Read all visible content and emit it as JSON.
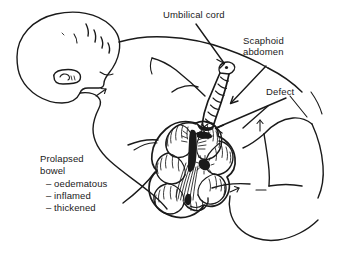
{
  "figure": {
    "background_color": "#ffffff",
    "ink_color": "#1a1a1a",
    "width": 341,
    "height": 260
  },
  "labels": {
    "umbilical_cord": "Umbilical cord",
    "scaphoid_abdomen_line1": "Scaphoid",
    "scaphoid_abdomen_line2": "abdomen",
    "defect": "Defect",
    "prolapsed_line1": "Prolapsed",
    "prolapsed_line2": "bowel",
    "prolapsed_item1": "– oedematous",
    "prolapsed_item2": "– inflamed",
    "prolapsed_item3": "– thickened"
  },
  "anatomy": {
    "head": "infant-head-profile",
    "ear": "ear",
    "hair": "hair-strokes",
    "neck": "neck",
    "torso": "torso",
    "arm": "arm",
    "legs": "legs",
    "umbilical_cord": "twisted-umbilical-cord",
    "cord_clamp": "cord-tip",
    "bowel_mass": "prolapsed-bowel-loops",
    "mesentery_shading": "dark-mesentery-hatching",
    "defect_site": "abdominal-wall-defect"
  },
  "leaders": {
    "umbilical_cord_arrow": "arrow-to-cord-tip",
    "scaphoid_abdomen_arrow": "arrow-to-abdomen",
    "defect_arrow": "arrow-to-defect",
    "prolapsed_bowel_leader": "line-to-bowel",
    "neck_tick_arrow": "small-arrow-neck",
    "flank_tick_arrow": "small-arrow-flank",
    "hip_tick_arrow": "small-arrow-hip"
  }
}
